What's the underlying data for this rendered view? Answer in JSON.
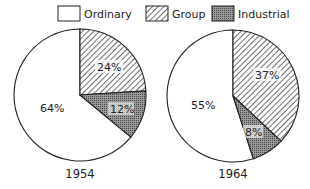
{
  "legend": [
    {
      "key": "ordinary",
      "label": "Ordinary",
      "fill": "white"
    },
    {
      "key": "group",
      "label": "Group",
      "fill": "hatch"
    },
    {
      "key": "industrial",
      "label": "Industrial",
      "fill": "dots"
    }
  ],
  "colors": {
    "stroke": "#222222",
    "background": "#ffffff",
    "industrial": "#8a8a8a"
  },
  "chart_data": [
    {
      "type": "pie",
      "title": "1954",
      "categories": [
        "Ordinary",
        "Group",
        "Industrial"
      ],
      "values": [
        64,
        24,
        12
      ],
      "labels": [
        "64%",
        "24%",
        "12%"
      ]
    },
    {
      "type": "pie",
      "title": "1964",
      "categories": [
        "Ordinary",
        "Group",
        "Industrial"
      ],
      "values": [
        55,
        37,
        8
      ],
      "labels": [
        "55%",
        "37%",
        "8%"
      ]
    }
  ]
}
